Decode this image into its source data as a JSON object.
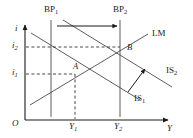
{
  "figure": {
    "kind": "is-lm-bp-diagram",
    "title": "",
    "axes": {
      "vertical_label": "i",
      "horizontal_label": "Y",
      "origin_label": "O"
    },
    "tick_labels": {
      "y_upper": "i",
      "y_upper_sub": "2",
      "y_lower": "i",
      "y_lower_sub": "1",
      "x_left": "Y",
      "x_left_sub": "1",
      "x_right": "Y",
      "x_right_sub": "2"
    },
    "curves": [
      {
        "id": "bp1",
        "label": "BP",
        "sub": "1",
        "type": "vertical",
        "note": "balance of payments line, initial"
      },
      {
        "id": "bp2",
        "label": "BP",
        "sub": "2",
        "type": "vertical",
        "note": "balance of payments line, shifted right"
      },
      {
        "id": "lm",
        "label": "LM",
        "sub": "",
        "type": "upward-sloping",
        "note": "money market equilibrium"
      },
      {
        "id": "is1",
        "label": "IS",
        "sub": "1",
        "type": "downward-sloping",
        "note": "goods market equilibrium, initial"
      },
      {
        "id": "is2",
        "label": "IS",
        "sub": "2",
        "type": "downward-sloping",
        "note": "goods market equilibrium, shifted out"
      }
    ],
    "points": [
      {
        "id": "A",
        "label": "A",
        "note": "intersection of IS1 and LM at i1, Y1"
      },
      {
        "id": "B",
        "label": "B",
        "note": "intersection of IS2 and LM at i2, Y2"
      }
    ],
    "arrows": [
      {
        "id": "bp-shift-arrow",
        "note": "horizontal arrow from BP1 to BP2 showing rightward shift"
      },
      {
        "id": "is-shift-arrow",
        "note": "diagonal arrow from IS1 to IS2 showing outward shift"
      }
    ],
    "colors": {
      "line": "#1a1a1a",
      "dashed": "#1a1a1a",
      "background": "#ffffff"
    }
  }
}
